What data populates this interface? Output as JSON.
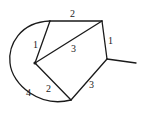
{
  "diagram": {
    "type": "weighted-graph",
    "vertices": [
      {
        "id": "A",
        "x": 50,
        "y": 21
      },
      {
        "id": "B",
        "x": 102,
        "y": 21
      },
      {
        "id": "C",
        "x": 35,
        "y": 63
      },
      {
        "id": "D",
        "x": 107,
        "y": 59
      },
      {
        "id": "E",
        "x": 71,
        "y": 100
      },
      {
        "id": "F",
        "x": 136,
        "y": 63
      }
    ],
    "edges": [
      {
        "from": "A",
        "to": "B",
        "weight": "2"
      },
      {
        "from": "A",
        "to": "C",
        "weight": "1"
      },
      {
        "from": "C",
        "to": "B",
        "weight": "3"
      },
      {
        "from": "B",
        "to": "D",
        "weight": "1"
      },
      {
        "from": "C",
        "to": "E",
        "weight": "2"
      },
      {
        "from": "E",
        "to": "D",
        "weight": "3"
      },
      {
        "from": "A",
        "to": "E",
        "weight": "4",
        "curved": true
      },
      {
        "from": "D",
        "to": "F",
        "weight": ""
      }
    ],
    "labels": {
      "ab": "2",
      "ac": "1",
      "cb": "3",
      "bd": "1",
      "ce": "2",
      "ed": "3",
      "ae_arc": "4"
    }
  }
}
